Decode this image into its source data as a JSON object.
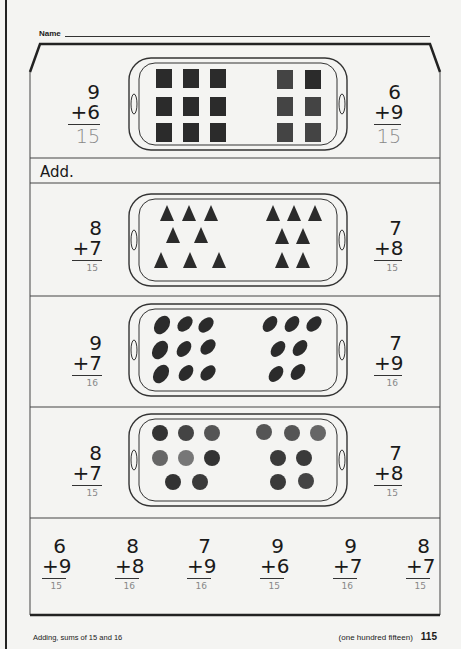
{
  "header": {
    "name_label": "Name"
  },
  "instruction": "Add.",
  "example": {
    "left": {
      "top": "9",
      "bottom": "+6",
      "answer": "15"
    },
    "right": {
      "top": "6",
      "bottom": "+9",
      "answer": "15"
    },
    "tray": {
      "left_items": 9,
      "right_items": 6,
      "item": "square"
    }
  },
  "rows": [
    {
      "left": {
        "top": "8",
        "bottom": "+7",
        "answer": "15"
      },
      "right": {
        "top": "7",
        "bottom": "+8",
        "answer": "15"
      },
      "tray": {
        "left_items": 8,
        "right_items": 7,
        "item": "triangle-cake"
      }
    },
    {
      "left": {
        "top": "9",
        "bottom": "+7",
        "answer": "16"
      },
      "right": {
        "top": "7",
        "bottom": "+9",
        "answer": "16"
      },
      "tray": {
        "left_items": 9,
        "right_items": 7,
        "item": "oval-cookie"
      }
    },
    {
      "left": {
        "top": "8",
        "bottom": "+7",
        "answer": "15"
      },
      "right": {
        "top": "7",
        "bottom": "+8",
        "answer": "15"
      },
      "tray": {
        "left_items": 8,
        "right_items": 7,
        "item": "round-sandwich-cookie"
      }
    }
  ],
  "drill": [
    {
      "top": "6",
      "bottom": "+9",
      "answer": "15"
    },
    {
      "top": "8",
      "bottom": "+8",
      "answer": "16"
    },
    {
      "top": "7",
      "bottom": "+9",
      "answer": "16"
    },
    {
      "top": "9",
      "bottom": "+6",
      "answer": "15"
    },
    {
      "top": "9",
      "bottom": "+7",
      "answer": "16"
    },
    {
      "top": "8",
      "bottom": "+7",
      "answer": "15"
    }
  ],
  "footer": {
    "topic": "Adding, sums of 15 and 16",
    "page_words": "(one hundred fifteen)",
    "page_number": "115"
  }
}
